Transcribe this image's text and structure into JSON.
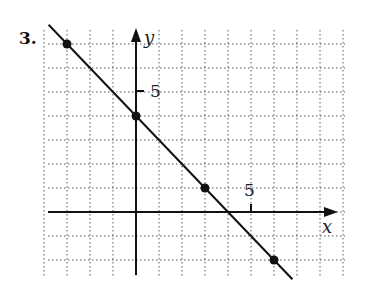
{
  "problem": {
    "number": "3."
  },
  "chart_data": {
    "type": "line",
    "title": "",
    "xlabel": "x",
    "ylabel": "y",
    "xlim": [
      -4,
      8
    ],
    "ylim": [
      -3,
      8
    ],
    "grid": true,
    "grid_style": "dotted",
    "tick_labels": {
      "x": [
        "5"
      ],
      "y": [
        "5"
      ]
    },
    "series": [
      {
        "name": "line",
        "equation": "y = -x + 4",
        "points": [
          {
            "x": -3,
            "y": 7
          },
          {
            "x": 0,
            "y": 4
          },
          {
            "x": 3,
            "y": 1
          },
          {
            "x": 6,
            "y": -2
          }
        ]
      }
    ]
  },
  "labels": {
    "x_axis": "x",
    "y_axis": "y",
    "x_tick": "5",
    "y_tick": "5"
  }
}
